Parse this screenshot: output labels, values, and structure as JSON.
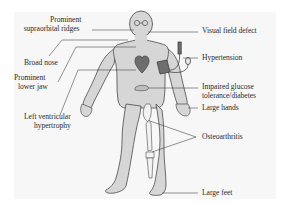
{
  "diagram": {
    "title": "",
    "colors": {
      "background": "#ffffff",
      "panel": "#f7f7f7",
      "skin": "#d6d6d6",
      "outline": "#4a4a4a",
      "leader_line": "#3a3a3a",
      "organ": "#6e6e6e",
      "bone": "#f2f2f2",
      "text": "#2b2b2b"
    },
    "labels": {
      "supraorbital_line1": "Prominent",
      "supraorbital_line2": "supraorbital ridges",
      "broad_nose": "Broad nose",
      "lower_jaw_line1": "Prominent",
      "lower_jaw_line2": "lower jaw",
      "lvh_line1": "Left ventricular",
      "lvh_line2": "hypertrophy",
      "visual_field": "Visual field defect",
      "hypertension": "Hypertension",
      "glucose_line1": "Impaired glucose",
      "glucose_line2": "tolerance/diabetes",
      "large_hands": "Large hands",
      "osteoarthritis": "Osteoarthritis",
      "large_feet": "Large feet"
    }
  }
}
